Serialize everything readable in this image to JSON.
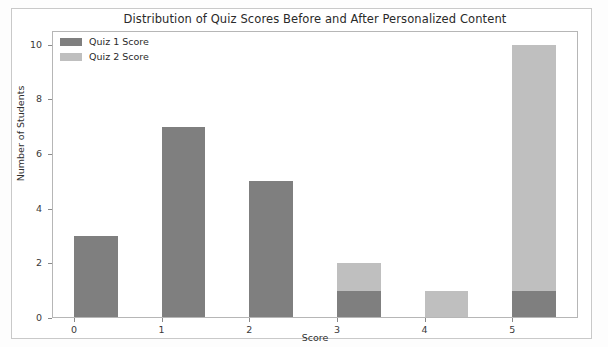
{
  "chart_data": {
    "type": "bar",
    "title": "Distribution of Quiz Scores Before and After Personalized Content",
    "xlabel": "Score",
    "ylabel": "Number of Students",
    "categories": [
      "0",
      "1",
      "2",
      "3",
      "4",
      "5"
    ],
    "xticks": [
      "0",
      "1",
      "2",
      "3",
      "4",
      "5"
    ],
    "yticks": [
      "0",
      "2",
      "4",
      "6",
      "8",
      "10"
    ],
    "xlim": [
      -0.25,
      5.75
    ],
    "ylim": [
      0,
      10.5
    ],
    "grid": false,
    "legend_position": "upper left",
    "overlap_style": "overlapping bars, shared region renders dark",
    "series": [
      {
        "name": "Quiz 1 Score",
        "color": "#7f7f7f",
        "values": [
          3,
          7,
          5,
          1,
          0,
          1
        ]
      },
      {
        "name": "Quiz 2 Score",
        "color": "#bfbfbf",
        "values": [
          0,
          0,
          0,
          2,
          1,
          10
        ]
      }
    ]
  },
  "legend": {
    "items": [
      {
        "label": "Quiz 1 Score",
        "swatch": "legend-swatch-quiz-1"
      },
      {
        "label": "Quiz 2 Score",
        "swatch": "legend-swatch-quiz-2"
      }
    ]
  }
}
